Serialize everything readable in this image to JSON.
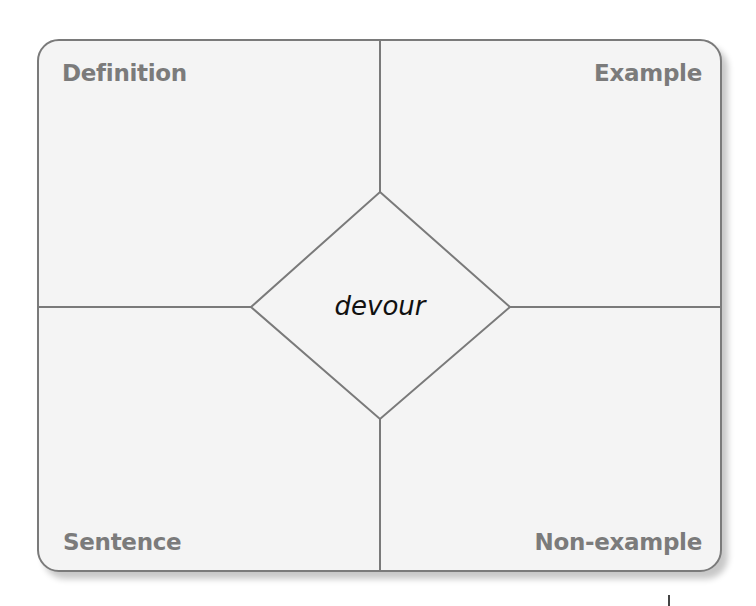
{
  "diagram": {
    "type": "frayer-model",
    "center_word": "devour",
    "quadrants": {
      "top_left": "Definition",
      "top_right": "Example",
      "bottom_left": "Sentence",
      "bottom_right": "Non-example"
    },
    "colors": {
      "border": "#7a7a7a",
      "label_text": "#7b7b7b",
      "background": "#f4f4f4",
      "center_text": "#111111"
    }
  }
}
